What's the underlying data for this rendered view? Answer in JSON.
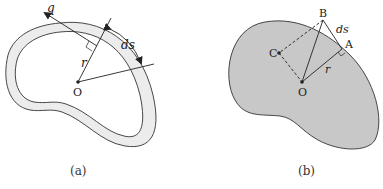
{
  "figure_a": {
    "caption": "(a)",
    "labels": {
      "q": "q",
      "ds": "ds",
      "r": "r",
      "O": "O"
    },
    "colors": {
      "wall_fill": "#ececec",
      "outline": "#333333",
      "background": "#ffffff"
    }
  },
  "figure_b": {
    "caption": "(b)",
    "labels": {
      "B": "B",
      "ds": "ds",
      "A": "A",
      "C": "C",
      "r": "r",
      "O": "O"
    },
    "colors": {
      "section_fill": "#c8c8c8",
      "outline": "#333333"
    }
  }
}
